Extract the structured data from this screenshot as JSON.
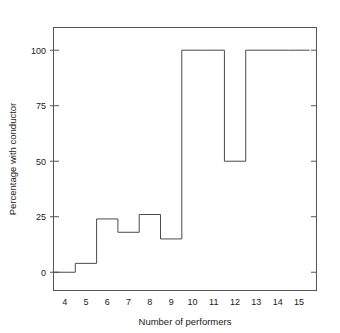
{
  "chart_data": {
    "type": "line",
    "subtype": "step-histogram",
    "title": "",
    "subtitle": "",
    "xlabel": "Number of performers",
    "ylabel": "Percentage with conductor",
    "categories": [
      4,
      5,
      6,
      7,
      8,
      9,
      10,
      11,
      12,
      13,
      14,
      15
    ],
    "values": [
      0,
      4,
      24,
      18,
      26,
      15,
      100,
      100,
      50,
      100,
      100,
      100
    ],
    "series": [
      {
        "name": "Percentage with conductor",
        "values": [
          0,
          4,
          24,
          18,
          26,
          15,
          100,
          100,
          50,
          100,
          100,
          100
        ]
      }
    ],
    "x": [
      4,
      5,
      6,
      7,
      8,
      9,
      10,
      11,
      12,
      13,
      14,
      15
    ],
    "xtick_labels": [
      "4",
      "5",
      "6",
      "7",
      "8",
      "9",
      "10",
      "11",
      "12",
      "13",
      "14",
      "15"
    ],
    "ytick_labels": [
      "0",
      "25",
      "50",
      "75",
      "100"
    ],
    "yticks": [
      0,
      25,
      50,
      75,
      100
    ],
    "xlim": [
      3.5,
      15.8
    ],
    "ylim": [
      -8,
      110
    ],
    "grid": false,
    "legend": false,
    "legend_position": "none",
    "line_color": "#4a4a4a",
    "axis_color": "#555555",
    "background_color": "#ffffff"
  },
  "axes": {
    "y_axis_label": "Percentage with conductor",
    "x_axis_label": "Number of performers",
    "y_ticks": [
      {
        "label": "100",
        "value": 100
      },
      {
        "label": "75",
        "value": 75
      },
      {
        "label": "50",
        "value": 50
      },
      {
        "label": "25",
        "value": 25
      },
      {
        "label": "0",
        "value": 0
      }
    ],
    "x_ticks": [
      {
        "label": "4",
        "value": 4
      },
      {
        "label": "5",
        "value": 5
      },
      {
        "label": "6",
        "value": 6
      },
      {
        "label": "7",
        "value": 7
      },
      {
        "label": "8",
        "value": 8
      },
      {
        "label": "9",
        "value": 9
      },
      {
        "label": "10",
        "value": 10
      },
      {
        "label": "11",
        "value": 11
      },
      {
        "label": "12",
        "value": 12
      },
      {
        "label": "13",
        "value": 13
      },
      {
        "label": "14",
        "value": 14
      },
      {
        "label": "15",
        "value": 15
      }
    ]
  }
}
